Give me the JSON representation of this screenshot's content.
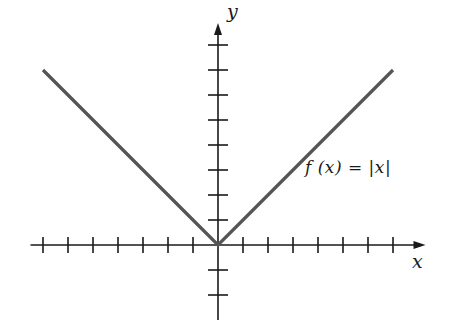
{
  "chart_data": {
    "type": "line",
    "title": "",
    "xlabel": "x",
    "ylabel": "y",
    "annotation": "f (x) = |x|",
    "function": "abs",
    "x": [
      -7,
      -6,
      -5,
      -4,
      -3,
      -2,
      -1,
      0,
      1,
      2,
      3,
      4,
      5,
      6,
      7
    ],
    "values": [
      7,
      6,
      5,
      4,
      3,
      2,
      1,
      0,
      1,
      2,
      3,
      4,
      5,
      6,
      7
    ],
    "xlim": [
      -7.5,
      8.3
    ],
    "ylim": [
      -3,
      9
    ],
    "x_ticks": [
      -7,
      -6,
      -5,
      -4,
      -3,
      -2,
      -1,
      1,
      2,
      3,
      4,
      5,
      6,
      7
    ],
    "y_ticks": [
      -2,
      -1,
      1,
      2,
      3,
      4,
      5,
      6,
      7,
      8
    ],
    "tick_labels_shown": false,
    "grid": false,
    "legend": null
  },
  "colors": {
    "axis": "#1a1a1a",
    "curve": "#555555"
  },
  "layout": {
    "origin_px": [
      218,
      245
    ],
    "unit_px": 25
  }
}
